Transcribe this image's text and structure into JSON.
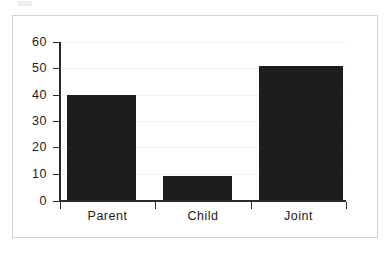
{
  "figure": {
    "background_color": "#ffffff",
    "frame_color": "#d2d2d2",
    "bar_color": "#1d1d1d",
    "axis_color": "#2b2b2b",
    "gridline_color": "#f1f1f1"
  },
  "chart_data": {
    "type": "bar",
    "title": "",
    "xlabel": "",
    "ylabel": "",
    "categories": [
      "Parent",
      "Child",
      "Joint"
    ],
    "values": [
      40,
      9,
      51
    ],
    "ylim": [
      0,
      60
    ],
    "yticks": [
      0,
      10,
      20,
      30,
      40,
      50,
      60
    ],
    "ytick_labels": [
      "0",
      "10",
      "20",
      "30",
      "40",
      "50",
      "60"
    ],
    "grid": true,
    "grid_axis": "y",
    "legend": false,
    "legend_position": "none",
    "series": [
      {
        "name": "",
        "values": [
          40,
          9,
          51
        ]
      }
    ]
  }
}
